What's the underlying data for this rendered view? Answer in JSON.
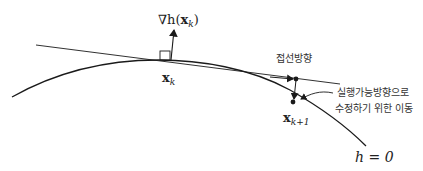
{
  "diagram": {
    "gradient_label": {
      "prefix": "∇h(",
      "x": "x",
      "sub": "k",
      "suffix": ")"
    },
    "point_xk": {
      "x": "x",
      "sub": "k"
    },
    "point_xk1": {
      "x": "x",
      "sub": "k+1"
    },
    "tangent_direction_label": "접선방향",
    "correction_label_line1": "실행가능방향으로",
    "correction_label_line2": "수정하기 위한 이동",
    "constraint_label": "h = 0",
    "colors": {
      "stroke": "#1a1a1a"
    }
  }
}
